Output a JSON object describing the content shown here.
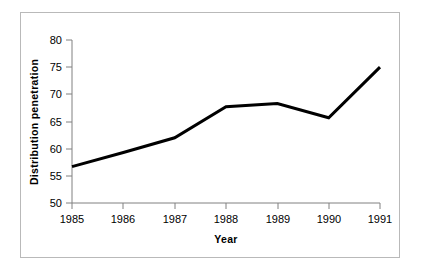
{
  "chart_data": {
    "type": "line",
    "title": "",
    "xlabel": "Year",
    "ylabel": "Distribution penetration",
    "categories": [
      "1985",
      "1986",
      "1987",
      "1988",
      "1989",
      "1990",
      "1991"
    ],
    "x": [
      1985,
      1986,
      1987,
      1988,
      1989,
      1990,
      1991
    ],
    "values": [
      56.7,
      59.3,
      62.0,
      67.7,
      68.3,
      65.7,
      75.0
    ],
    "series": [
      {
        "name": "Distribution penetration",
        "values": [
          56.7,
          59.3,
          62.0,
          67.7,
          68.3,
          65.7,
          75.0
        ]
      }
    ],
    "xlim": [
      1985,
      1991
    ],
    "ylim": [
      50,
      80
    ],
    "yticks": [
      50,
      55,
      60,
      65,
      70,
      75,
      80
    ],
    "ytick_labels": [
      "50",
      "55",
      "60",
      "65",
      "70",
      "75",
      "80"
    ],
    "xticks": [
      1985,
      1986,
      1987,
      1988,
      1989,
      1990,
      1991
    ],
    "xtick_labels": [
      "1985",
      "1986",
      "1987",
      "1988",
      "1989",
      "1990",
      "1991"
    ],
    "grid": false,
    "legend": false,
    "legend_position": "none",
    "line_color": "#000000",
    "line_width": 3,
    "axis_color": "#808080",
    "border_color": "#b9b9b9",
    "background_color": "#ffffff",
    "markers": false
  }
}
